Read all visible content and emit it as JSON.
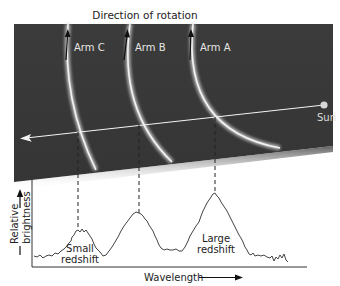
{
  "title": "Direction of rotation",
  "arms": [
    {
      "label": "Arm C"
    },
    {
      "label": "Arm B"
    },
    {
      "label": "Arm A"
    }
  ],
  "sun_label": "Sun",
  "graph": {
    "y_label_line1": "Relative",
    "y_label_line2": "brightness",
    "x_label": "Wavelength",
    "annotations": {
      "small": {
        "line1": "Small",
        "line2": "redshift"
      },
      "large": {
        "line1": "Large",
        "line2": "redshift"
      }
    }
  },
  "colors": {
    "panel": "#3a3a3a",
    "arm_glow": "#e8e8e8",
    "line": "#555555"
  }
}
